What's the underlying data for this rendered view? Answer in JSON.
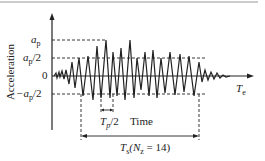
{
  "diagram": {
    "y_axis_label": "Acceleration",
    "x_axis_label": "Time",
    "x_axis_end_label": "T",
    "x_axis_end_sub": "e",
    "levels": [
      {
        "id": "ap",
        "label": "a",
        "sub": "p",
        "suffix": ""
      },
      {
        "id": "ap_half",
        "label": "a",
        "sub": "p",
        "suffix": "/2"
      },
      {
        "id": "zero",
        "label": "0",
        "sub": "",
        "suffix": ""
      },
      {
        "id": "neg_ap_half",
        "label": "−a",
        "sub": "p",
        "suffix": "/2"
      }
    ],
    "tp_label": "T",
    "tp_sub": "p",
    "tp_suffix": "/2",
    "ts_label": "T",
    "ts_sub": "s",
    "ts_paren_open": "(N",
    "ts_nz_sub": "z",
    "ts_paren_close": " = 14)",
    "colors": {
      "line": "#222222",
      "border": "#888888"
    }
  }
}
